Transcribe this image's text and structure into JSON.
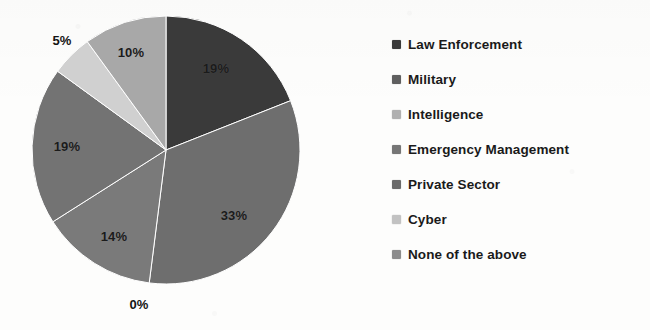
{
  "chart_data": {
    "type": "pie",
    "title": "",
    "legend_position": "right",
    "categories": [
      "Law Enforcement",
      "Military",
      "Intelligence",
      "Emergency Management",
      "Private Sector",
      "Cyber",
      "None of the above"
    ],
    "values": [
      19,
      33,
      0,
      14,
      19,
      5,
      10
    ],
    "value_labels": [
      "19%",
      "33%",
      "0%",
      "14%",
      "19%",
      "5%",
      "10%"
    ],
    "colors": [
      "#3a3a3a",
      "#6e6e6e",
      "#9a9a9a",
      "#7a7a7a",
      "#737373",
      "#d0d0d0",
      "#a8a8a8"
    ],
    "start_angle_deg": 0,
    "direction": "clockwise",
    "slices": [
      {
        "name": "Law Enforcement",
        "value": 19,
        "label": "19%",
        "color": "#3a3a3a",
        "label_x": 216,
        "label_y": 68,
        "label_placement": "inside",
        "label_tone": "on-dark"
      },
      {
        "name": "Military",
        "value": 33,
        "label": "33%",
        "color": "#6e6e6e",
        "label_x": 234,
        "label_y": 215,
        "label_placement": "inside",
        "label_tone": "on-dark"
      },
      {
        "name": "Intelligence",
        "value": 0,
        "label": "0%",
        "color": "#9a9a9a",
        "label_x": 139,
        "label_y": 304,
        "label_placement": "outside",
        "label_tone": "outside"
      },
      {
        "name": "Emergency Management",
        "value": 14,
        "label": "14%",
        "color": "#7a7a7a",
        "label_x": 114,
        "label_y": 236,
        "label_placement": "inside",
        "label_tone": "on-dark"
      },
      {
        "name": "Private Sector",
        "value": 19,
        "label": "19%",
        "color": "#737373",
        "label_x": 67,
        "label_y": 146,
        "label_placement": "inside",
        "label_tone": "on-dark"
      },
      {
        "name": "Cyber",
        "value": 5,
        "label": "5%",
        "color": "#d0d0d0",
        "label_x": 62,
        "label_y": 40,
        "label_placement": "outside",
        "label_tone": "outside"
      },
      {
        "name": "None of the above",
        "value": 10,
        "label": "10%",
        "color": "#a8a8a8",
        "label_x": 131,
        "label_y": 52,
        "label_placement": "inside",
        "label_tone": "on-dark"
      }
    ],
    "geometry": {
      "center_x": 166,
      "center_y": 150,
      "radius": 134
    }
  },
  "legend": {
    "items": [
      {
        "label": "Law Enforcement",
        "color": "#3a3a3a"
      },
      {
        "label": "Military",
        "color": "#5f5f5f"
      },
      {
        "label": "Intelligence",
        "color": "#b0b0b0"
      },
      {
        "label": "Emergency Management",
        "color": "#767676"
      },
      {
        "label": "Private Sector",
        "color": "#6a6a6a"
      },
      {
        "label": "Cyber",
        "color": "#c2c2c2"
      },
      {
        "label": "None of the above",
        "color": "#8c8c8c"
      }
    ]
  }
}
